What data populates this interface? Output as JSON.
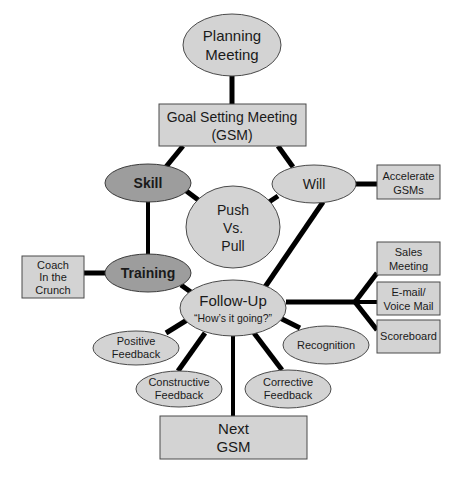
{
  "diagram": {
    "type": "process-flow",
    "colors": {
      "light_node_fill": "#d3d3d3",
      "dark_node_fill": "#9d9d9d",
      "edge_color": "#000000",
      "text_color": "#1a1a1a",
      "background": "#ffffff"
    },
    "nodes": {
      "planning": {
        "shape": "ellipse",
        "lines": [
          "Planning",
          "Meeting"
        ]
      },
      "gsm": {
        "shape": "rect",
        "lines": [
          "Goal Setting Meeting",
          "(GSM)"
        ]
      },
      "skill": {
        "shape": "ellipse",
        "style": "dark-bold",
        "lines": [
          "Skill"
        ]
      },
      "will": {
        "shape": "ellipse",
        "lines": [
          "Will"
        ]
      },
      "accelerate": {
        "shape": "rect",
        "lines": [
          "Accelerate",
          "GSMs"
        ]
      },
      "push_pull": {
        "shape": "ellipse",
        "lines": [
          "Push",
          "Vs.",
          "Pull"
        ]
      },
      "training": {
        "shape": "ellipse",
        "style": "dark-bold",
        "lines": [
          "Training"
        ]
      },
      "coach": {
        "shape": "rect",
        "lines": [
          "Coach",
          "In the",
          "Crunch"
        ]
      },
      "follow_up": {
        "shape": "ellipse",
        "lines": [
          "Follow-Up",
          "“How’s it going?”"
        ]
      },
      "sales_meeting": {
        "shape": "rect",
        "lines": [
          "Sales",
          "Meeting"
        ]
      },
      "email": {
        "shape": "rect",
        "lines": [
          "E-mail/",
          "Voice Mail"
        ]
      },
      "scoreboard": {
        "shape": "rect",
        "lines": [
          "Scoreboard"
        ]
      },
      "positive": {
        "shape": "ellipse",
        "lines": [
          "Positive",
          "Feedback"
        ]
      },
      "recognition": {
        "shape": "ellipse",
        "lines": [
          "Recognition"
        ]
      },
      "constructive": {
        "shape": "ellipse",
        "lines": [
          "Constructive",
          "Feedback"
        ]
      },
      "corrective": {
        "shape": "ellipse",
        "lines": [
          "Corrective",
          "Feedback"
        ]
      },
      "next_gsm": {
        "shape": "rect",
        "lines": [
          "Next",
          "GSM"
        ]
      }
    },
    "edges": [
      [
        "planning",
        "gsm"
      ],
      [
        "gsm",
        "skill"
      ],
      [
        "gsm",
        "will"
      ],
      [
        "skill",
        "push_pull"
      ],
      [
        "will",
        "push_pull"
      ],
      [
        "will",
        "accelerate"
      ],
      [
        "skill",
        "training"
      ],
      [
        "training",
        "coach"
      ],
      [
        "training",
        "follow_up"
      ],
      [
        "will",
        "follow_up"
      ],
      [
        "follow_up",
        "sales_meeting"
      ],
      [
        "follow_up",
        "email"
      ],
      [
        "follow_up",
        "scoreboard"
      ],
      [
        "follow_up",
        "positive"
      ],
      [
        "follow_up",
        "constructive"
      ],
      [
        "follow_up",
        "next_gsm"
      ],
      [
        "follow_up",
        "corrective"
      ],
      [
        "follow_up",
        "recognition"
      ]
    ]
  }
}
